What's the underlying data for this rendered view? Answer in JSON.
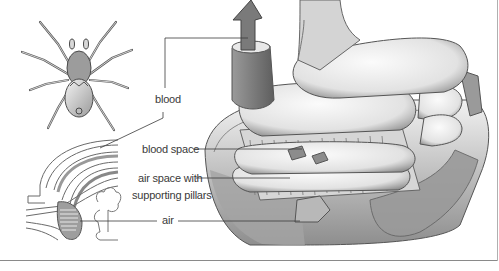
{
  "figure": {
    "panels": [
      {
        "name": "spider",
        "description": "Dorsal view of a spider"
      },
      {
        "name": "book-lung-section",
        "description": "Cross-section of spider abdomen showing book lung"
      },
      {
        "name": "book-lung-detail",
        "description": "Enlarged cutaway of book lung lamellae"
      }
    ],
    "labels": {
      "blood": "blood",
      "blood_space": "blood space",
      "air_space_line1": "air space with",
      "air_space_line2": "supporting pillars",
      "air": "air"
    },
    "colors": {
      "line": "#3a3a3a",
      "shade_dark": "#6e6e6e",
      "shade_mid": "#a8a8a8",
      "shade_light": "#e4e4e4",
      "rule": "#8a8a8a"
    }
  }
}
